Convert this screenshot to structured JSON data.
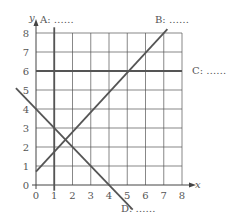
{
  "chart_data": {
    "type": "line",
    "title": "",
    "xlabel": "x",
    "ylabel": "y",
    "xlim": [
      0,
      8
    ],
    "ylim": [
      0,
      8
    ],
    "grid": true,
    "x_ticks": [
      "0",
      "1",
      "2",
      "3",
      "4",
      "5",
      "6",
      "7",
      "8"
    ],
    "y_ticks": [
      "0",
      "1",
      "2",
      "3",
      "4",
      "5",
      "6",
      "7",
      "8"
    ],
    "series": [
      {
        "name": "A",
        "label": "A: ……",
        "equation": "x = 1",
        "points": [
          [
            1,
            -0.3
          ],
          [
            1,
            8.3
          ]
        ]
      },
      {
        "name": "B",
        "label": "B: ……",
        "equation": "y = x + 1",
        "points": [
          [
            0,
            0.7
          ],
          [
            7.2,
            8.2
          ]
        ]
      },
      {
        "name": "C",
        "label": "C: ……",
        "equation": "y = 6",
        "points": [
          [
            0,
            6
          ],
          [
            8,
            6
          ]
        ]
      },
      {
        "name": "D",
        "label": "D: ……",
        "equation": "y = -x + 4",
        "points": [
          [
            -1.1,
            5.1
          ],
          [
            5.3,
            -1.3
          ]
        ]
      }
    ]
  },
  "labels": {
    "x_axis": "x",
    "y_axis": "y",
    "line_a": "A: ……",
    "line_b": "B: ……",
    "line_c": "C: ……",
    "line_d": "D: ……"
  },
  "colors": {
    "grid": "#555555",
    "axis": "#444444",
    "line": "#555555",
    "text": "#555555"
  }
}
